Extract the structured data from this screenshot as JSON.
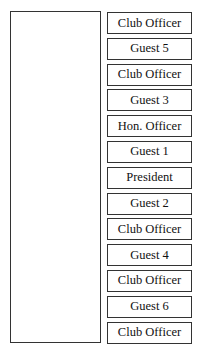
{
  "diagram": {
    "type": "seating-chart",
    "table": {
      "label": ""
    },
    "seats": [
      {
        "label": "Club Officer"
      },
      {
        "label": "Guest 5"
      },
      {
        "label": "Club Officer"
      },
      {
        "label": "Guest 3"
      },
      {
        "label": "Hon. Officer"
      },
      {
        "label": "Guest 1"
      },
      {
        "label": "President"
      },
      {
        "label": "Guest 2"
      },
      {
        "label": "Club Officer"
      },
      {
        "label": "Guest 4"
      },
      {
        "label": "Club Officer"
      },
      {
        "label": "Guest 6"
      },
      {
        "label": "Club Officer"
      }
    ]
  }
}
